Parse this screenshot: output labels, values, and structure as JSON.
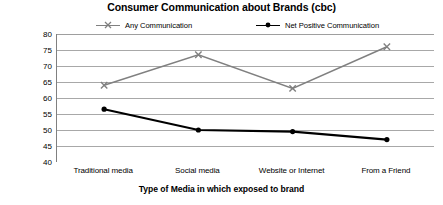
{
  "chart_data": {
    "type": "line",
    "title": "Consumer Communication about Brands (cbc)",
    "xlabel": "Type of Media in which exposed to brand",
    "ylabel": "",
    "categories": [
      "Traditional media",
      "Social media",
      "Website or Internet",
      "From a Friend"
    ],
    "series": [
      {
        "name": "Any Communication",
        "color": "#808080",
        "marker": "x",
        "values": [
          64,
          73.5,
          63,
          76
        ]
      },
      {
        "name": "Net Positive Communication",
        "color": "#000000",
        "marker": "circle",
        "values": [
          56.5,
          50,
          49.5,
          47
        ]
      }
    ],
    "ylim": [
      40,
      80
    ],
    "yticks": [
      80,
      75,
      70,
      65,
      60,
      55,
      50,
      45,
      40
    ],
    "ytick_labels": [
      "80",
      "75",
      "70",
      "65",
      "60",
      "55",
      "50",
      "45",
      "40"
    ],
    "grid": true,
    "grid_color": "#9e9e9e",
    "legend_position": "top"
  }
}
